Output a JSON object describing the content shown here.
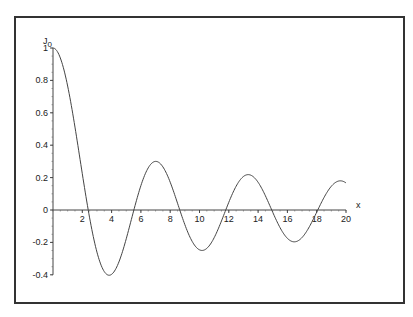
{
  "chart_data": {
    "type": "line",
    "title": "",
    "xlabel": "x",
    "ylabel": "J0",
    "ylabel_main": "J",
    "ylabel_sub": "0",
    "xlim": [
      0,
      20
    ],
    "ylim": [
      -0.4,
      1
    ],
    "grid": false,
    "legend": null,
    "x_ticks": [
      2,
      4,
      6,
      8,
      10,
      12,
      14,
      16,
      18,
      20
    ],
    "x_tick_labels": [
      "2",
      "4",
      "6",
      "8",
      "10",
      "12",
      "14",
      "16",
      "18",
      "20"
    ],
    "y_ticks": [
      1,
      0.8,
      0.6,
      0.4,
      0.2,
      0,
      -0.2,
      -0.4
    ],
    "y_tick_labels": [
      "1",
      "0.8",
      "0.6",
      "0.4",
      "0.2",
      "0",
      "-0.2",
      "-0.4"
    ],
    "series": [
      {
        "name": "J0(x)",
        "function": "Bessel function of the first kind, order 0",
        "x": [
          0,
          1,
          2,
          2.405,
          3,
          3.832,
          4,
          5,
          5.52,
          6,
          7,
          7.016,
          8,
          8.654,
          9,
          10,
          10.17,
          11,
          11.79,
          12,
          13,
          13.32,
          14,
          14.93,
          15,
          16,
          16.47,
          17,
          18,
          18.07,
          19,
          19.62,
          20
        ],
        "values": [
          1.0,
          0.765,
          0.224,
          0.0,
          -0.26,
          -0.403,
          -0.397,
          -0.178,
          0.0,
          0.151,
          0.3,
          0.3,
          0.172,
          0.0,
          -0.09,
          -0.246,
          -0.25,
          -0.171,
          0.0,
          0.048,
          0.207,
          0.218,
          0.171,
          0.0,
          -0.014,
          -0.175,
          -0.202,
          -0.17,
          -0.014,
          0.0,
          0.147,
          0.185,
          0.167
        ]
      }
    ],
    "annotations": []
  }
}
